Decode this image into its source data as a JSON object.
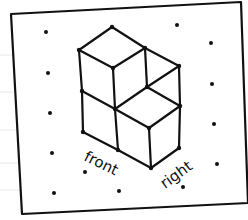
{
  "diagram": {
    "labels": {
      "front": "front",
      "right": "right"
    },
    "colors": {
      "ink": "#111111",
      "paper": "#ffffff",
      "ruled_lines": "#e6e6e6"
    },
    "cube_count_visible": 4
  }
}
